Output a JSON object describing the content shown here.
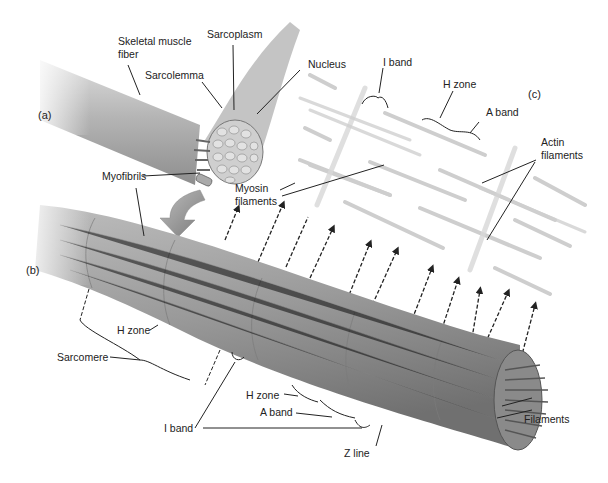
{
  "panels": {
    "a": "(a)",
    "b": "(b)",
    "c": "(c)"
  },
  "labels": {
    "skeletal_muscle_fiber_line1": "Skeletal muscle",
    "skeletal_muscle_fiber_line2": "fiber",
    "sarcoplasm": "Sarcoplasm",
    "sarcolemma": "Sarcolemma",
    "nucleus": "Nucleus",
    "myofibrils": "Myofibrils",
    "myosin_filaments_line1": "Myosin",
    "myosin_filaments_line2": "filaments",
    "i_band_top": "I band",
    "h_zone_top": "H zone",
    "a_band_top": "A band",
    "actin_filaments_line1": "Actin",
    "actin_filaments_line2": "filaments",
    "h_zone_left": "H zone",
    "sarcomere": "Sarcomere",
    "h_zone_bottom": "H zone",
    "a_band_bottom": "A band",
    "i_band_bottom": "I band",
    "z_line": "Z line",
    "filaments": "Filaments"
  },
  "colors": {
    "background": "#ffffff",
    "fiber": "#9a9a9a",
    "fiber_dark": "#6e6e6e",
    "filament": "#c8c8c8",
    "arrow": "#8c8c8c",
    "leader": "#222222"
  }
}
